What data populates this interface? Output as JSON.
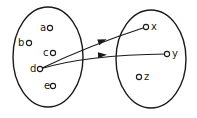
{
  "diagram": {
    "type": "set-mapping",
    "colors": {
      "stroke": "#1a1a1a",
      "background": "#ffffff"
    },
    "sets": [
      {
        "id": "domain",
        "cx": 48,
        "cy": 57,
        "rx": 35,
        "ry": 50
      },
      {
        "id": "codomain",
        "cx": 151,
        "cy": 59,
        "rx": 35,
        "ry": 49
      }
    ],
    "elements": [
      {
        "set": "domain",
        "label": "a",
        "dot_x": 50,
        "dot_y": 28,
        "label_x": 40,
        "label_y": 31
      },
      {
        "set": "domain",
        "label": "b",
        "dot_x": 29,
        "dot_y": 43,
        "label_x": 18,
        "label_y": 46
      },
      {
        "set": "domain",
        "label": "c",
        "dot_x": 53,
        "dot_y": 53,
        "label_x": 43,
        "label_y": 56
      },
      {
        "set": "domain",
        "label": "d",
        "dot_x": 40,
        "dot_y": 69,
        "label_x": 30,
        "label_y": 72
      },
      {
        "set": "domain",
        "label": "e",
        "dot_x": 53,
        "dot_y": 86,
        "label_x": 44,
        "label_y": 89
      },
      {
        "set": "codomain",
        "label": "x",
        "dot_x": 146,
        "dot_y": 27,
        "label_x": 151,
        "label_y": 30
      },
      {
        "set": "codomain",
        "label": "y",
        "dot_x": 167,
        "dot_y": 54,
        "label_x": 172,
        "label_y": 57
      },
      {
        "set": "codomain",
        "label": "z",
        "dot_x": 139,
        "dot_y": 77,
        "label_x": 144,
        "label_y": 80
      }
    ],
    "relations": [
      {
        "from": "d",
        "to": "x",
        "path": "M40,69 Q90,45 146,27",
        "arrow_x": 102,
        "arrow_y": 41,
        "arrow_angle": -20
      },
      {
        "from": "d",
        "to": "y",
        "path": "M40,69 Q85,55 167,54",
        "arrow_x": 102,
        "arrow_y": 55,
        "arrow_angle": -2
      }
    ]
  }
}
